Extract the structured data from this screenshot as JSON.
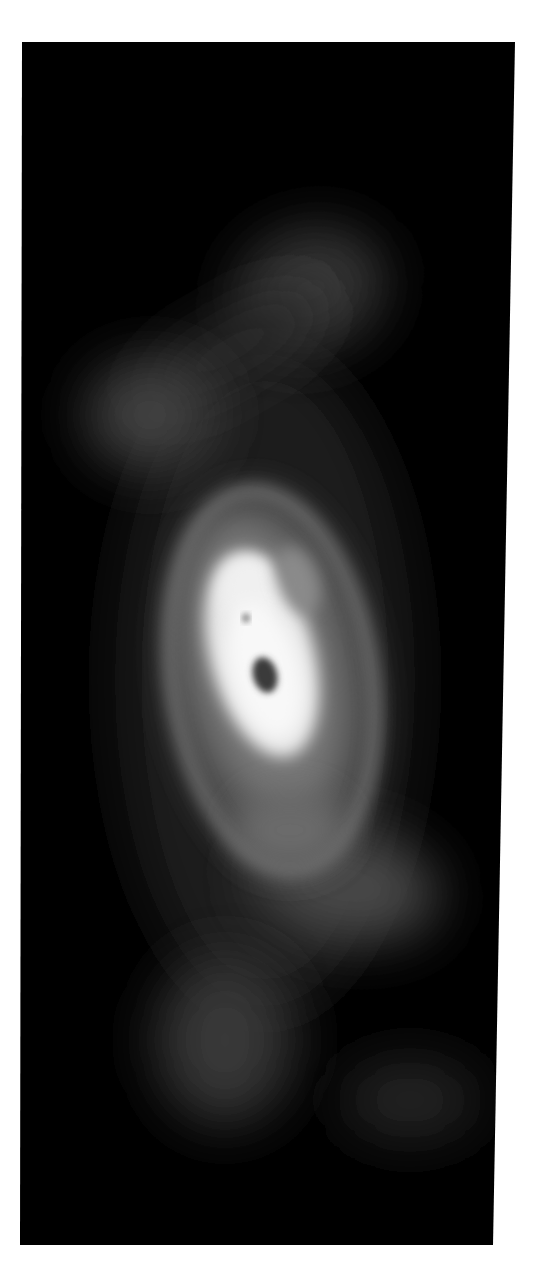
{
  "image": {
    "description": "Grayscale astronomical-style image of a bright elongated core with a dark central spot, surrounded by a halo ring and faint diffuse lobes above and below, on a black field within a white border",
    "background_color": "#ffffff",
    "panel_color": "#000000",
    "panel": {
      "x": 22,
      "y": 42,
      "width": 493,
      "height": 1203
    },
    "features": [
      {
        "name": "upper-right-lobe",
        "cx": 310,
        "cy": 290,
        "rx": 75,
        "ry": 60,
        "gray": "#3a3a3a"
      },
      {
        "name": "upper-left-lobe",
        "cx": 150,
        "cy": 415,
        "rx": 65,
        "ry": 55,
        "gray": "#404040"
      },
      {
        "name": "halo-ring",
        "cx": 270,
        "cy": 680,
        "rx": 105,
        "ry": 200,
        "gray": "#6e6e6e"
      },
      {
        "name": "bright-core",
        "cx": 262,
        "cy": 650,
        "rx": 52,
        "ry": 110,
        "gray": "#f2f2f2"
      },
      {
        "name": "core-dark-spot",
        "cx": 265,
        "cy": 675,
        "rx": 12,
        "ry": 18,
        "gray": "#303030"
      },
      {
        "name": "core-small-dot",
        "cx": 246,
        "cy": 618,
        "rx": 3,
        "ry": 4,
        "gray": "#404040"
      },
      {
        "name": "lower-right-lobe",
        "cx": 345,
        "cy": 885,
        "rx": 95,
        "ry": 55,
        "gray": "#4a4a4a"
      },
      {
        "name": "lower-left-lobe",
        "cx": 225,
        "cy": 1040,
        "rx": 70,
        "ry": 85,
        "gray": "#383838"
      },
      {
        "name": "bottom-right-lobe",
        "cx": 410,
        "cy": 1100,
        "rx": 70,
        "ry": 40,
        "gray": "#2a2a2a"
      }
    ]
  }
}
